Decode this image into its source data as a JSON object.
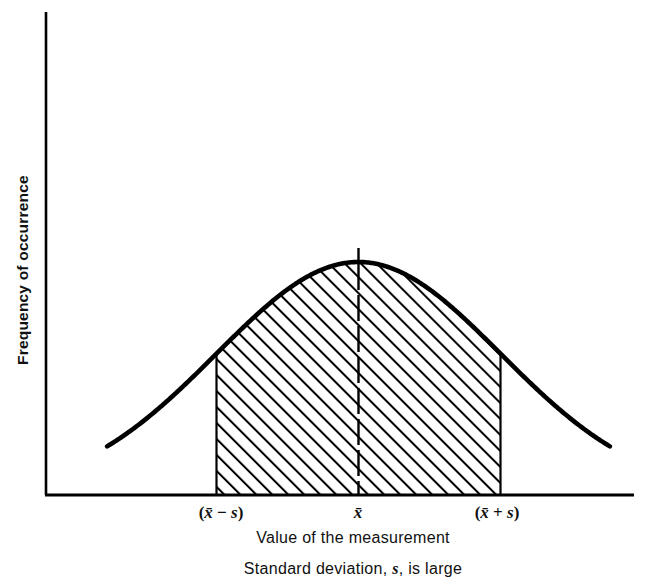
{
  "figure": {
    "kind": "normal-distribution-curve",
    "line_color": "#000000",
    "background_color": "#ffffff",
    "hatch_color": "#000000"
  },
  "axes": {
    "y_label": "Frequency of occurrence",
    "x_label": "Value of the measurement",
    "caption": "Standard deviation, ",
    "caption_em": "s",
    "caption_tail": ", is large"
  },
  "ticks": {
    "left": {
      "open": "(",
      "bar": "x̄",
      "op": " − ",
      "sym": "s",
      "close": ")"
    },
    "center": {
      "bar": "x̄"
    },
    "right": {
      "open": "(",
      "bar": "x̄",
      "op": " + ",
      "sym": "s",
      "close": ")"
    }
  },
  "chart_data": {
    "type": "line",
    "title": "",
    "subtitle": "Standard deviation, s, is large",
    "xlabel": "Value of the measurement",
    "ylabel": "Frequency of occurrence",
    "grid": false,
    "legend": "none",
    "distribution": "normal",
    "mean_label": "x̄",
    "sd_label": "s",
    "sd_magnitude": "large",
    "shaded_region": {
      "from_label": "(x̄ − s)",
      "to_label": "(x̄ + s)",
      "fill": "diagonal-hatch"
    },
    "xtick_labels": [
      "(x̄ − s)",
      "x̄",
      "(x̄ + s)"
    ],
    "xtick_positions": [
      -1,
      0,
      1
    ],
    "ytick_labels": [],
    "xlim": [
      -1.77,
      1.77
    ],
    "ylim": [
      0,
      1.0
    ],
    "x": [
      -1.77,
      -1.6,
      -1.4,
      -1.2,
      -1.0,
      -0.8,
      -0.6,
      -0.4,
      -0.2,
      0.0,
      0.2,
      0.4,
      0.6,
      0.8,
      1.0,
      1.2,
      1.4,
      1.6,
      1.77
    ],
    "y": [
      0.21,
      0.28,
      0.37,
      0.49,
      0.61,
      0.73,
      0.84,
      0.92,
      0.98,
      1.0,
      0.98,
      0.92,
      0.84,
      0.73,
      0.61,
      0.49,
      0.37,
      0.28,
      0.21
    ],
    "annotations": [
      {
        "name": "peak-tick",
        "at_x": 0,
        "text": ""
      },
      {
        "name": "center-dashed-line",
        "at_x": 0,
        "text": ""
      }
    ]
  }
}
